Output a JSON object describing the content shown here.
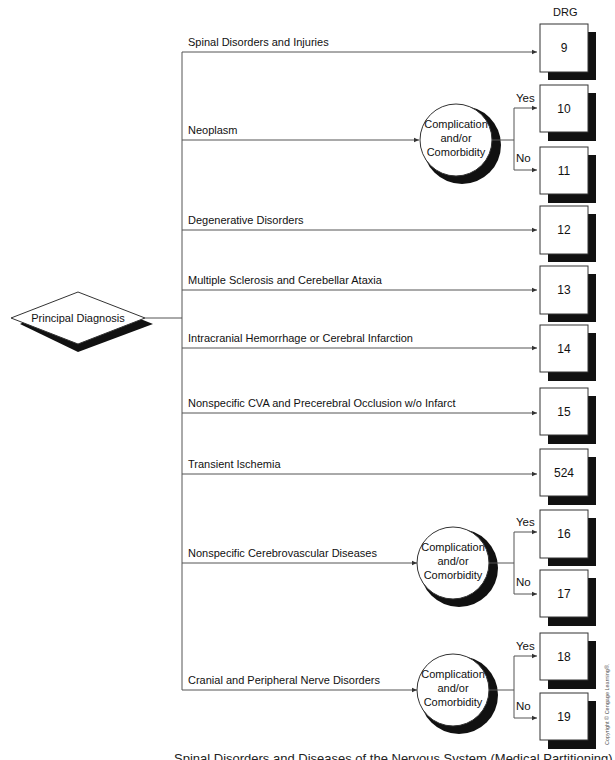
{
  "header": {
    "drg_column_label": "DRG"
  },
  "root_node": {
    "label": "Principal Diagnosis",
    "shape": "diamond"
  },
  "decision_node_label": [
    "Complication",
    "and/or",
    "Comorbidity"
  ],
  "branch_labels": {
    "yes": "Yes",
    "no": "No"
  },
  "branches": [
    {
      "label": "Spinal Disorders and Injuries",
      "drg": "9"
    },
    {
      "label": "Neoplasm",
      "decision": true,
      "drg_yes": "10",
      "drg_no": "11"
    },
    {
      "label": "Degenerative Disorders",
      "drg": "12"
    },
    {
      "label": "Multiple Sclerosis and Cerebellar Ataxia",
      "drg": "13"
    },
    {
      "label": "Intracranial Hemorrhage or Cerebral Infarction",
      "drg": "14"
    },
    {
      "label": "Nonspecific CVA and Precerebral Occlusion w/o Infarct",
      "drg": "15"
    },
    {
      "label": "Transient Ischemia",
      "drg": "524"
    },
    {
      "label": "Nonspecific Cerebrovascular Diseases",
      "decision": true,
      "drg_yes": "16",
      "drg_no": "17"
    },
    {
      "label": "Cranial and Peripheral Nerve Disorders",
      "decision": true,
      "drg_yes": "18",
      "drg_no": "19"
    }
  ],
  "caption": "Spinal Disorders and Diseases of the Nervous System (Medical Partitioning)",
  "copyright": "Copyright © Cengage Learning®.",
  "colors": {
    "line": "#555555",
    "shadow": "#111111",
    "box_fill": "#ffffff",
    "box_border": "#333333"
  }
}
